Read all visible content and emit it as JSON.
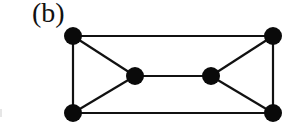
{
  "figure": {
    "panel_label": "(b)",
    "colors": {
      "edge": "#111111",
      "node": "#0a0a0a",
      "background": "#ffffff"
    },
    "node_radius": 9,
    "edge_width": 2.2
  },
  "graph": {
    "nodes": [
      {
        "id": "top-left",
        "x": 73,
        "y": 36
      },
      {
        "id": "top-right",
        "x": 273,
        "y": 36
      },
      {
        "id": "middle-left",
        "x": 135,
        "y": 76
      },
      {
        "id": "middle-right",
        "x": 211,
        "y": 76
      },
      {
        "id": "bottom-left",
        "x": 73,
        "y": 113
      },
      {
        "id": "bottom-right",
        "x": 273,
        "y": 113
      }
    ],
    "edges": [
      [
        "top-left",
        "top-right"
      ],
      [
        "top-left",
        "bottom-left"
      ],
      [
        "top-left",
        "middle-left"
      ],
      [
        "bottom-left",
        "middle-left"
      ],
      [
        "bottom-left",
        "bottom-right"
      ],
      [
        "middle-left",
        "middle-right"
      ],
      [
        "top-right",
        "middle-right"
      ],
      [
        "bottom-right",
        "middle-right"
      ],
      [
        "top-right",
        "bottom-right"
      ]
    ]
  }
}
